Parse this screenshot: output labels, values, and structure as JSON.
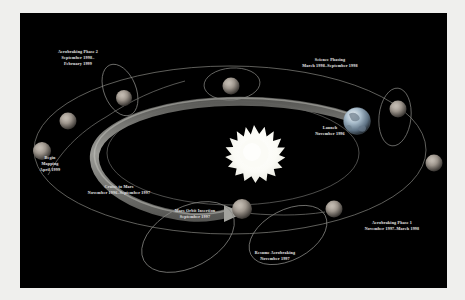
{
  "diagram": {
    "background_color": "#000000",
    "frame_color": "#efefed",
    "label_color": "#d8d8d8",
    "orbit_line_color": "#8a8a86",
    "cruise_band_color": "#8e8e8a"
  },
  "center_body": {
    "name": "sun",
    "icon": "sun-burst-icon",
    "color": "#ffffff",
    "points": 18
  },
  "bodies": [
    {
      "name": "earth-globe",
      "label_key": "launch",
      "color": "#b9c4cf"
    },
    {
      "name": "mars-globe-mars-orbit-insertion",
      "color": "#9a938c"
    },
    {
      "name": "mars-globe-resume-aerobraking",
      "color": "#9a938c"
    },
    {
      "name": "mars-globe-aerobraking-phase-1",
      "color": "#9a938c"
    },
    {
      "name": "mars-globe-aerobraking-phase-1-lower",
      "color": "#9a938c"
    },
    {
      "name": "mars-globe-science-phasing",
      "color": "#9a938c"
    },
    {
      "name": "mars-globe-aerobraking-phase-2",
      "color": "#9a938c"
    },
    {
      "name": "mars-globe-upper-left",
      "color": "#9a938c"
    },
    {
      "name": "mars-globe-begin-mapping",
      "color": "#9a938c"
    }
  ],
  "labels": {
    "aerobraking_phase_2": {
      "line1": "Aerobraking Phase 2",
      "line2": "September 1998–",
      "line3": "February 1999"
    },
    "science_phasing": {
      "line1": "Science Phasing",
      "line2": "March 1998–September 1998"
    },
    "launch": {
      "line1": "Launch",
      "line2": "November 1996"
    },
    "begin_mapping": {
      "line1": "Begin",
      "line2": "Mapping",
      "line3": "April 1999"
    },
    "cruise_to_mars": {
      "line1": "Cruise to Mars",
      "line2": "November 1996–September 1997"
    },
    "mars_orbit_insertion": {
      "line1": "Mars Orbit Insertion",
      "line2": "September 1997"
    },
    "resume_aerobraking": {
      "line1": "Resume Aerobraking",
      "line2": "November 1997"
    },
    "aerobraking_phase_1": {
      "line1": "Aerobraking Phase 1",
      "line2": "November 1997–March 1998"
    }
  }
}
